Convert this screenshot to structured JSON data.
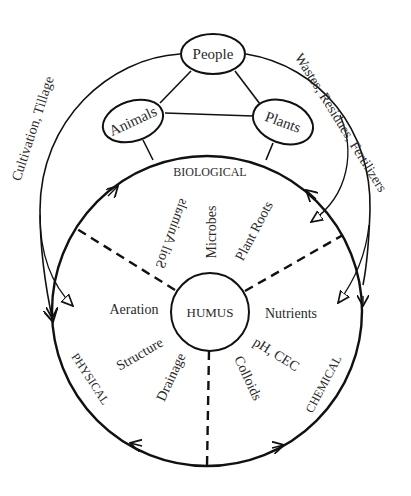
{
  "diagram": {
    "nodes": {
      "people": "People",
      "animals": "Animals",
      "plants": "Plants",
      "humus": "HUMUS"
    },
    "outer_flows": {
      "left": "Cultivation, Tillage",
      "right": "Wastes, Residues, Fertilizers"
    },
    "sectors": {
      "biological": {
        "title": "BIOLOGICAL",
        "items": [
          "Soil Animals",
          "Microbes",
          "Plant Roots"
        ]
      },
      "physical": {
        "title": "PHYSICAL",
        "items": [
          "Aeration",
          "Structure",
          "Drainage"
        ]
      },
      "chemical": {
        "title": "CHEMICAL",
        "items": [
          "Nutrients",
          "pH, CEC",
          "Colloids"
        ]
      }
    },
    "colors": {
      "line": "#111111",
      "text": "#2a2a2a",
      "background": "#ffffff"
    }
  }
}
